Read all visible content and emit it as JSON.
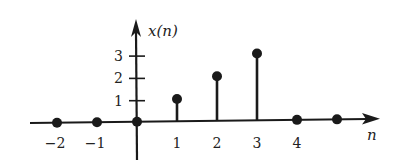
{
  "chart_data": {
    "type": "stem",
    "title": "",
    "xlabel": "n",
    "ylabel": "x(n)",
    "x": [
      -2,
      -1,
      0,
      1,
      2,
      3,
      4,
      5
    ],
    "values": [
      0,
      0,
      0,
      1,
      2,
      3,
      0,
      0
    ],
    "x_tick_labels": [
      "−2",
      "−1",
      "1",
      "2",
      "3",
      "4"
    ],
    "x_tick_positions": [
      -2,
      -1,
      1,
      2,
      3,
      4
    ],
    "y_tick_labels": [
      "1",
      "2",
      "3"
    ],
    "y_ticks": [
      1,
      2,
      3
    ],
    "ylim": [
      0,
      3
    ],
    "grid": false,
    "legend": null
  },
  "colors": {
    "ink": "#1a1a1a",
    "background": "#ffffff"
  }
}
